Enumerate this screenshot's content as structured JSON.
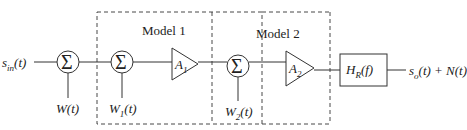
{
  "diagram": {
    "input_signal": "s_in(t)",
    "output_signal": "s_o(t) + N(t)",
    "summers": [
      {
        "symbol": "Σ",
        "noise_input": "W(t)"
      },
      {
        "symbol": "Σ",
        "noise_input": "W1(t)"
      },
      {
        "symbol": "Σ",
        "noise_input": "W2(t)"
      }
    ],
    "amplifiers": [
      {
        "label": "A1"
      },
      {
        "label": "A2"
      }
    ],
    "filter": {
      "label": "H_R(f)"
    },
    "groups": [
      {
        "title": "Model 1"
      },
      {
        "title": "Model 2"
      }
    ]
  }
}
